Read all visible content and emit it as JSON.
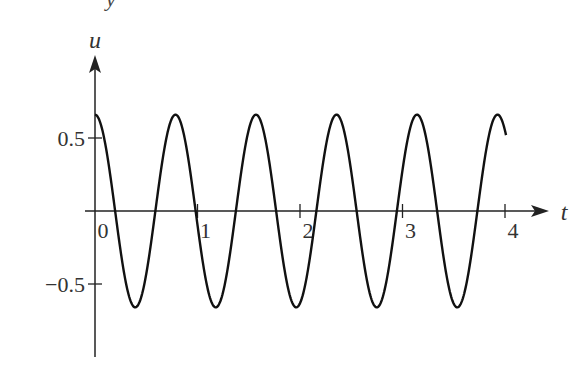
{
  "chart_data": {
    "type": "line",
    "title": "",
    "partial_top_glyph": "y",
    "xlabel": "t",
    "ylabel": "u",
    "function": "u(t) = 0.66 cos(8t)",
    "amplitude": 0.66,
    "angular_frequency": 8,
    "x_range": [
      0,
      4.01
    ],
    "xlim": [
      0,
      4.3
    ],
    "ylim": [
      -0.93,
      1.07
    ],
    "x_ticks": [
      0,
      1,
      2,
      3,
      4
    ],
    "x_tick_labels": [
      "0",
      "1",
      "2",
      "3",
      "4"
    ],
    "y_ticks": [
      0.5,
      -0.5
    ],
    "y_tick_labels": [
      "0.5",
      "−0.5"
    ],
    "grid": false,
    "legend": null,
    "series": [
      {
        "name": "u(t)",
        "x": [
          0,
          0.196,
          0.393,
          0.589,
          0.785,
          0.982,
          1.178,
          1.374,
          1.571,
          1.767,
          1.963,
          2.16,
          2.356,
          2.553,
          2.749,
          2.945,
          3.142,
          3.338,
          3.534,
          3.731,
          3.927,
          4.01
        ],
        "values": [
          0.66,
          0.0,
          -0.66,
          0.0,
          0.66,
          0.0,
          -0.66,
          0.0,
          0.66,
          0.0,
          -0.66,
          0.0,
          0.66,
          0.0,
          -0.66,
          0.0,
          0.66,
          0.0,
          -0.66,
          0.0,
          0.66,
          0.55
        ]
      }
    ]
  },
  "style": {
    "axis_color": "#222222",
    "curve_color": "#111111",
    "label_color": "#333333"
  },
  "layout": {
    "origin_px": [
      95,
      211
    ],
    "px_per_t": 102.5,
    "px_per_u": 146
  }
}
